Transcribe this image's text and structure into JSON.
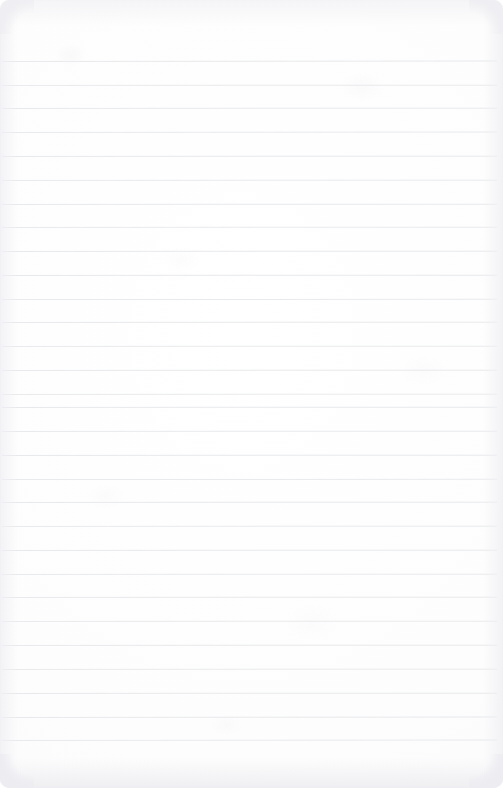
{
  "page": {
    "kind": "ruled-notebook-page",
    "width": 503,
    "height": 788,
    "paper_color": "#fdfdfd",
    "is_blank": true,
    "written_text": "",
    "header_text": "",
    "footer_text": "",
    "page_number": "",
    "margin_rule": "none"
  },
  "ruling": {
    "line_color": "#e7e8eb",
    "line_thickness_px": 1,
    "line_count": 30,
    "first_line_y": 61,
    "line_spacing_px": 23.7,
    "last_line_y": 740,
    "line_start_x": 2,
    "line_end_x": 497,
    "top_margin_px": 61,
    "bottom_margin_px": 48,
    "lines": [
      {
        "index": 1,
        "y": 61,
        "x1": 2,
        "x2": 497,
        "tilt": -0.9,
        "opacity": 0.95,
        "text": ""
      },
      {
        "index": 2,
        "y": 85,
        "x1": 2,
        "x2": 497,
        "tilt": -0.7,
        "opacity": 0.92,
        "text": ""
      },
      {
        "index": 3,
        "y": 108,
        "x1": 2,
        "x2": 497,
        "tilt": -0.6,
        "opacity": 0.96,
        "text": ""
      },
      {
        "index": 4,
        "y": 132,
        "x1": 2,
        "x2": 497,
        "tilt": -0.8,
        "opacity": 0.9,
        "text": ""
      },
      {
        "index": 5,
        "y": 156,
        "x1": 2,
        "x2": 497,
        "tilt": -0.5,
        "opacity": 0.95,
        "text": ""
      },
      {
        "index": 6,
        "y": 180,
        "x1": 2,
        "x2": 497,
        "tilt": -0.7,
        "opacity": 0.93,
        "text": ""
      },
      {
        "index": 7,
        "y": 204,
        "x1": 2,
        "x2": 497,
        "tilt": -0.6,
        "opacity": 0.97,
        "text": ""
      },
      {
        "index": 8,
        "y": 227,
        "x1": 2,
        "x2": 497,
        "tilt": -0.5,
        "opacity": 0.91,
        "text": ""
      },
      {
        "index": 9,
        "y": 251,
        "x1": 2,
        "x2": 497,
        "tilt": -0.7,
        "opacity": 0.95,
        "text": ""
      },
      {
        "index": 10,
        "y": 275,
        "x1": 2,
        "x2": 497,
        "tilt": -0.6,
        "opacity": 0.94,
        "text": ""
      },
      {
        "index": 11,
        "y": 299,
        "x1": 2,
        "x2": 497,
        "tilt": -0.4,
        "opacity": 0.92,
        "text": ""
      },
      {
        "index": 12,
        "y": 322,
        "x1": 2,
        "x2": 497,
        "tilt": -0.6,
        "opacity": 0.96,
        "text": ""
      },
      {
        "index": 13,
        "y": 346,
        "x1": 2,
        "x2": 497,
        "tilt": -0.7,
        "opacity": 0.9,
        "text": ""
      },
      {
        "index": 14,
        "y": 370,
        "x1": 2,
        "x2": 497,
        "tilt": -0.5,
        "opacity": 0.95,
        "text": ""
      },
      {
        "index": 15,
        "y": 394,
        "x1": 2,
        "x2": 497,
        "tilt": -0.6,
        "opacity": 0.93,
        "text": ""
      },
      {
        "index": 16,
        "y": 407,
        "x1": 2,
        "x2": 497,
        "tilt": -0.5,
        "opacity": 0.97,
        "text": ""
      },
      {
        "index": 17,
        "y": 431,
        "x1": 2,
        "x2": 497,
        "tilt": -0.7,
        "opacity": 0.92,
        "text": ""
      },
      {
        "index": 18,
        "y": 455,
        "x1": 2,
        "x2": 497,
        "tilt": -0.6,
        "opacity": 0.95,
        "text": ""
      },
      {
        "index": 19,
        "y": 479,
        "x1": 2,
        "x2": 497,
        "tilt": -0.4,
        "opacity": 0.91,
        "text": ""
      },
      {
        "index": 20,
        "y": 502,
        "x1": 2,
        "x2": 497,
        "tilt": -0.6,
        "opacity": 0.96,
        "text": ""
      },
      {
        "index": 21,
        "y": 526,
        "x1": 2,
        "x2": 497,
        "tilt": -0.7,
        "opacity": 0.93,
        "text": ""
      },
      {
        "index": 22,
        "y": 550,
        "x1": 2,
        "x2": 497,
        "tilt": -0.5,
        "opacity": 0.95,
        "text": ""
      },
      {
        "index": 23,
        "y": 574,
        "x1": 2,
        "x2": 497,
        "tilt": -0.6,
        "opacity": 0.9,
        "text": ""
      },
      {
        "index": 24,
        "y": 597,
        "x1": 2,
        "x2": 497,
        "tilt": -0.5,
        "opacity": 0.96,
        "text": ""
      },
      {
        "index": 25,
        "y": 621,
        "x1": 2,
        "x2": 497,
        "tilt": -0.7,
        "opacity": 0.92,
        "text": ""
      },
      {
        "index": 26,
        "y": 645,
        "x1": 2,
        "x2": 497,
        "tilt": -0.6,
        "opacity": 0.95,
        "text": ""
      },
      {
        "index": 27,
        "y": 669,
        "x1": 2,
        "x2": 497,
        "tilt": -0.5,
        "opacity": 0.93,
        "text": ""
      },
      {
        "index": 28,
        "y": 693,
        "x1": 2,
        "x2": 497,
        "tilt": -0.6,
        "opacity": 0.97,
        "text": ""
      },
      {
        "index": 29,
        "y": 717,
        "x1": 2,
        "x2": 497,
        "tilt": -0.8,
        "opacity": 0.94,
        "text": ""
      },
      {
        "index": 30,
        "y": 740,
        "x1": 2,
        "x2": 497,
        "tilt": -0.9,
        "opacity": 0.92,
        "text": ""
      }
    ]
  },
  "edges": {
    "corner_radius_px": 10,
    "shadow_color": "#eeeef2",
    "has_top_shadow": true,
    "has_bottom_shadow": true,
    "has_left_shadow": true,
    "has_right_shadow": true
  }
}
